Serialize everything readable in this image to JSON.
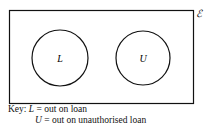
{
  "diagram": {
    "type": "venn",
    "universal_set_symbol": "ℰ",
    "sets": [
      {
        "label": "L",
        "cx": 60,
        "cy": 58,
        "r": 28
      },
      {
        "label": "U",
        "cx": 143,
        "cy": 58,
        "r": 27
      }
    ],
    "key": {
      "prefix": "Key:",
      "entries": [
        {
          "symbol": "L",
          "text": "= out on loan"
        },
        {
          "symbol": "U",
          "text": "= out on unauthorised loan"
        }
      ]
    }
  }
}
